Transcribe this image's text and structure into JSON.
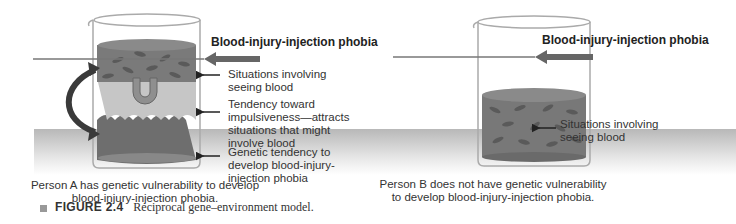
{
  "panel_a": {
    "threshold_label": "Blood-injury-injection phobia",
    "labels": [
      "Situations involving seeing blood",
      "Tendency toward impulsiveness—attracts situations that might involve blood",
      "Genetic tendency to develop blood-injury-injection phobia"
    ],
    "caption_line1": "Person A has genetic vulnerability to develop",
    "caption_line2": "blood-injury-injection phobia."
  },
  "panel_b": {
    "threshold_label": "Blood-injury-injection phobia",
    "labels": [
      "Situations involving seeing blood"
    ],
    "caption_line1": "Person B does not have genetic vulnerability",
    "caption_line2": "to develop blood-injury-injection phobia."
  },
  "figure": {
    "number": "FIGURE 2.4",
    "title": "Reciprocal gene–environment model."
  }
}
